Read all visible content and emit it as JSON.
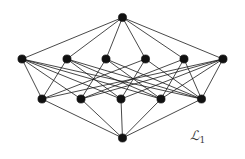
{
  "figure": {
    "kind": "hasse-diagram",
    "label_main": "ℒ",
    "label_sub": "1",
    "label_full": "ℒ1",
    "width": 245,
    "height": 159,
    "background_color": "#ffffff",
    "node_color": "#111111",
    "edge_color": "#1a1a1a",
    "node_radius": 4.1,
    "edge_width": 0.8
  },
  "graph_data": {
    "type": "graph",
    "description": "Lattice Hasse diagram with 13 vertices arranged in four ranks: one top element, six upper-middle elements, five lower-middle elements, one bottom element.",
    "rank_counts": [
      1,
      6,
      5,
      1
    ],
    "node_count": 13,
    "edge_count": 34,
    "nodes": [
      {
        "id": "t",
        "rank": 0,
        "x": 122.5,
        "y": 17.5
      },
      {
        "id": "a1",
        "rank": 1,
        "x": 22.0,
        "y": 59.0
      },
      {
        "id": "a2",
        "rank": 1,
        "x": 67.0,
        "y": 59.0
      },
      {
        "id": "a3",
        "rank": 1,
        "x": 106.0,
        "y": 59.0
      },
      {
        "id": "a4",
        "rank": 1,
        "x": 145.5,
        "y": 59.0
      },
      {
        "id": "a5",
        "rank": 1,
        "x": 184.0,
        "y": 59.0
      },
      {
        "id": "a6",
        "rank": 1,
        "x": 223.0,
        "y": 59.0
      },
      {
        "id": "b1",
        "rank": 2,
        "x": 42.0,
        "y": 99.0
      },
      {
        "id": "b2",
        "rank": 2,
        "x": 81.0,
        "y": 99.0
      },
      {
        "id": "b3",
        "rank": 2,
        "x": 121.0,
        "y": 99.0
      },
      {
        "id": "b4",
        "rank": 2,
        "x": 161.0,
        "y": 99.0
      },
      {
        "id": "b5",
        "rank": 2,
        "x": 201.5,
        "y": 99.0
      },
      {
        "id": "o",
        "rank": 3,
        "x": 122.5,
        "y": 138.0
      }
    ],
    "edges": [
      [
        "t",
        "a1"
      ],
      [
        "t",
        "a2"
      ],
      [
        "t",
        "a3"
      ],
      [
        "t",
        "a4"
      ],
      [
        "t",
        "a5"
      ],
      [
        "t",
        "a6"
      ],
      [
        "a1",
        "b1"
      ],
      [
        "a1",
        "b2"
      ],
      [
        "a1",
        "b3"
      ],
      [
        "a1",
        "b4"
      ],
      [
        "a2",
        "b1"
      ],
      [
        "a2",
        "b3"
      ],
      [
        "a3",
        "b2"
      ],
      [
        "a3",
        "b4"
      ],
      [
        "a4",
        "b1"
      ],
      [
        "a4",
        "b3"
      ],
      [
        "a5",
        "b2"
      ],
      [
        "a5",
        "b4"
      ],
      [
        "a6",
        "b1"
      ],
      [
        "a6",
        "b2"
      ],
      [
        "a6",
        "b4"
      ],
      [
        "a6",
        "b5"
      ],
      [
        "a2",
        "b5"
      ],
      [
        "a3",
        "b5"
      ],
      [
        "a4",
        "b5"
      ],
      [
        "a5",
        "b5"
      ],
      [
        "b1",
        "o"
      ],
      [
        "b2",
        "o"
      ],
      [
        "b3",
        "o"
      ],
      [
        "b4",
        "o"
      ],
      [
        "b5",
        "o"
      ],
      [
        "a1",
        "b5"
      ],
      [
        "a6",
        "b3"
      ],
      [
        "a2",
        "b4"
      ]
    ]
  }
}
